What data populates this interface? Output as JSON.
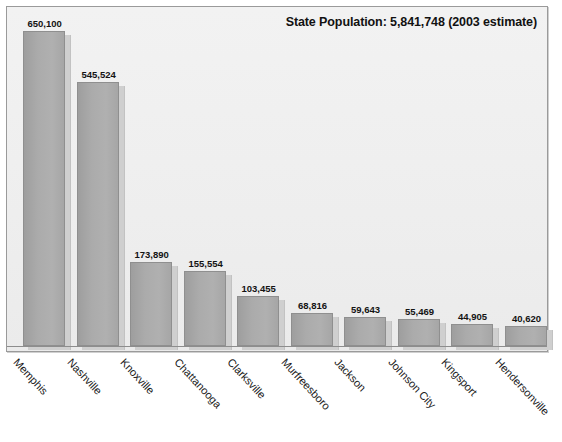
{
  "chart_data": {
    "type": "bar",
    "title": "State Population: 5,841,748  (2003 estimate)",
    "xlabel": "",
    "ylabel": "",
    "grid": false,
    "legend": "none",
    "ylim": [
      0,
      650100
    ],
    "categories": [
      "Memphis",
      "Nashville",
      "Knoxville",
      "Chattanooga",
      "Clarksville",
      "Murfreesboro",
      "Jackson",
      "Johnson City",
      "Kingsport",
      "Hendersonville"
    ],
    "values": [
      650100,
      545524,
      173890,
      155554,
      103455,
      68816,
      59643,
      55469,
      44905,
      40620
    ],
    "value_labels": [
      "650,100",
      "545,524",
      "173,890",
      "155,554",
      "103,455",
      "68,816",
      "59,643",
      "55,469",
      "44,905",
      "40,620"
    ]
  },
  "style": {
    "bar_fill": "#ababab",
    "bar_border": "#8f8f8f",
    "bar_shadow": "#cfcfcf",
    "plot_background": "#f0f0f0",
    "frame_border": "#9a9a9a",
    "text_color": "#131313",
    "page_background": "#ffffff"
  }
}
